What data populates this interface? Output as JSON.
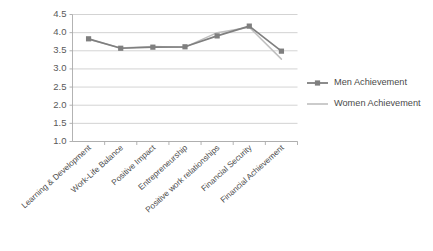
{
  "chart_data": {
    "type": "line",
    "title": "",
    "xlabel": "",
    "ylabel": "",
    "ylim": [
      1.0,
      4.5
    ],
    "ytick_labels": [
      "1.0",
      "1.5",
      "2.0",
      "2.5",
      "3.0",
      "3.5",
      "4.0",
      "4.5"
    ],
    "ytick_values": [
      1.0,
      1.5,
      2.0,
      2.5,
      3.0,
      3.5,
      4.0,
      4.5
    ],
    "grid": true,
    "legend_position": "right",
    "categories": [
      "Learning & Development",
      "Work-Life Balance",
      "Positive Impact",
      "Entrepreneurship",
      "Positive work relationships",
      "Financial Security",
      "Financial Achievement"
    ],
    "series": [
      {
        "name": "Men Achievement",
        "color": "#7f7f7f",
        "marker": "square",
        "values": [
          3.83,
          3.57,
          3.6,
          3.61,
          3.91,
          4.18,
          3.49
        ]
      },
      {
        "name": "Women Achievement",
        "color": "#bfbfbf",
        "marker": "none",
        "values": [
          3.82,
          3.58,
          3.62,
          3.6,
          4.0,
          4.15,
          3.27
        ]
      }
    ]
  },
  "legend": {
    "entries": [
      {
        "label": "Men Achievement"
      },
      {
        "label": "Women Achievement"
      }
    ]
  }
}
